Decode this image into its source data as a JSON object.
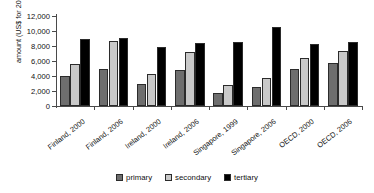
{
  "chart_data": {
    "type": "bar",
    "title": "",
    "xlabel": "",
    "ylabel": "amount (US$ for 2000)",
    "ylim": [
      0,
      12000
    ],
    "ytick_labels": [
      "12,000",
      "10,000",
      "8,000",
      "6,000",
      "4,000",
      "2,000",
      "0"
    ],
    "ytick_values": [
      12000,
      10000,
      8000,
      6000,
      4000,
      2000,
      0
    ],
    "grid": false,
    "legend_position": "bottom",
    "categories": [
      "Finland, 2000",
      "Finland, 2006",
      "Ireland, 2000",
      "Ireland, 2006",
      "Singapore, 1999",
      "Singapore, 2006",
      "OECD, 2000",
      "OECD, 2006"
    ],
    "series": [
      {
        "name": "primary",
        "color": "#6e6e6e",
        "values": [
          4000,
          5000,
          2900,
          4800,
          1700,
          2500,
          4950,
          5700
        ]
      },
      {
        "name": "secondary",
        "color": "#c9c9c9",
        "values": [
          5650,
          8700,
          4250,
          7250,
          2750,
          3700,
          6350,
          7400
        ]
      },
      {
        "name": "tertiary",
        "color": "#000000",
        "values": [
          9000,
          9100,
          7900,
          8400,
          8600,
          10600,
          8250,
          8600
        ]
      }
    ]
  }
}
